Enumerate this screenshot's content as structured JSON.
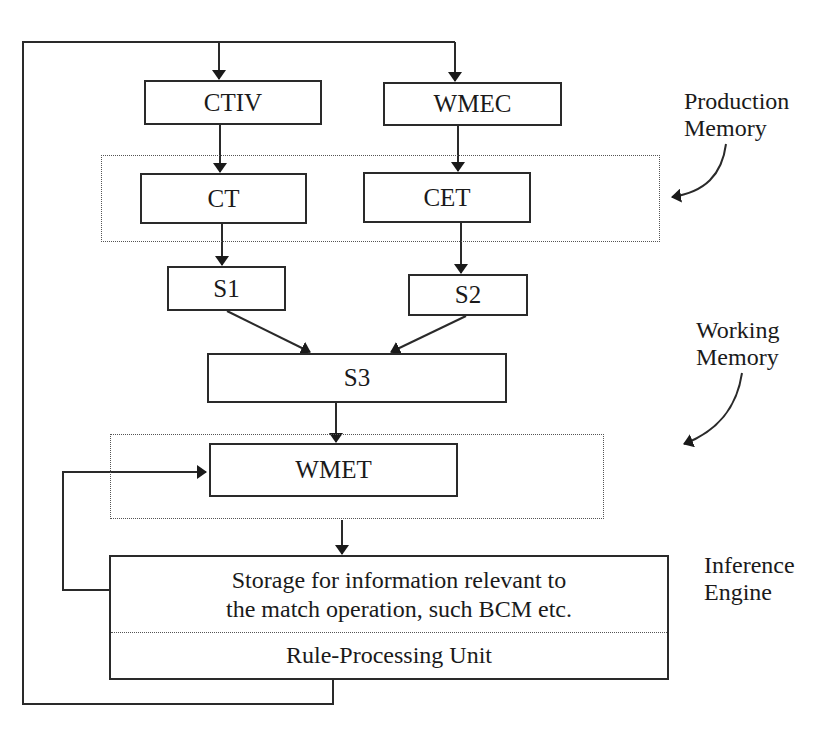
{
  "diagram": {
    "nodes": {
      "ctiv": "CTIV",
      "wmec": "WMEC",
      "ct": "CT",
      "cet": "CET",
      "s1": "S1",
      "s2": "S2",
      "s3": "S3",
      "wmet": "WMET"
    },
    "inference_box": {
      "storage_line1": "Storage for information relevant to",
      "storage_line2": "the match operation, such BCM etc.",
      "rule_unit": "Rule-Processing Unit"
    },
    "annotations": {
      "production_memory_line1": "Production",
      "production_memory_line2": "Memory",
      "working_memory_line1": "Working",
      "working_memory_line2": "Memory",
      "inference_engine_line1": "Inference",
      "inference_engine_line2": "Engine"
    },
    "colors": {
      "line": "#2a2a2a",
      "dotted": "#555555",
      "background": "#ffffff"
    }
  }
}
